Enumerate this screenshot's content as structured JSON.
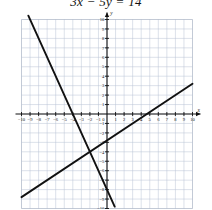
{
  "figure": {
    "equation_label": "3x − 5y = 14",
    "axis_label_x": "x",
    "axis_label_y": "y"
  },
  "chart_data": {
    "type": "line",
    "title": "3x − 5y = 14",
    "xlabel": "x",
    "ylabel": "y",
    "xlim": [
      -10,
      10
    ],
    "ylim": [
      -10,
      10
    ],
    "grid": true,
    "legend": "none",
    "xticks": [
      -10,
      -9,
      -8,
      -7,
      -6,
      -5,
      -4,
      -3,
      -2,
      -1,
      0,
      1,
      2,
      3,
      4,
      5,
      6,
      7,
      8,
      9,
      10
    ],
    "yticks": [
      -10,
      -9,
      -8,
      -7,
      -6,
      -5,
      -4,
      -3,
      -2,
      -1,
      0,
      1,
      2,
      3,
      4,
      5,
      6,
      7,
      8,
      9,
      10
    ],
    "xtick_labels": [
      "-10",
      "-9",
      "-8",
      "-7",
      "-6",
      "-5",
      "-4",
      "-3",
      "-2",
      "-1",
      "0",
      "1",
      "2",
      "3",
      "4",
      "5",
      "6",
      "7",
      "8",
      "9",
      "10"
    ],
    "ytick_labels": [
      "-10",
      "-9",
      "-8",
      "-7",
      "-6",
      "-5",
      "-4",
      "-3",
      "-2",
      "-1",
      "0",
      "1",
      "2",
      "3",
      "4",
      "5",
      "6",
      "7",
      "8",
      "9",
      "10"
    ],
    "series": [
      {
        "name": "3x - 5y = 14",
        "equation": "y = 0.6x - 2.8",
        "slope": 0.6,
        "intercept": -2.8,
        "x": [
          -10,
          10
        ],
        "values": [
          -8.8,
          3.2
        ],
        "style": "solid-thick"
      },
      {
        "name": "second line",
        "equation": "y = -2x - 8",
        "slope": -2,
        "intercept": -8,
        "x": [
          -9.2,
          0.9
        ],
        "values": [
          10.4,
          -9.8
        ],
        "style": "solid-thick"
      }
    ],
    "annotations": [
      {
        "label": "intersection",
        "x": -2,
        "y": -4
      }
    ]
  }
}
